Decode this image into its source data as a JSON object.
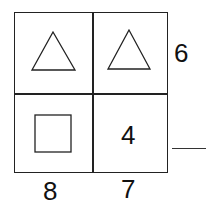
{
  "puzzle": {
    "cells": [
      {
        "row": 0,
        "col": 0,
        "shape": "triangle"
      },
      {
        "row": 0,
        "col": 1,
        "shape": "triangle"
      },
      {
        "row": 1,
        "col": 0,
        "shape": "square"
      },
      {
        "row": 1,
        "col": 1,
        "value": "4"
      }
    ],
    "row_sums": [
      "6",
      ""
    ],
    "col_sums": [
      "8",
      "7"
    ],
    "cell_value_4": "4",
    "row_sum_top": "6",
    "col_sum_left": "8",
    "col_sum_right": "7"
  }
}
